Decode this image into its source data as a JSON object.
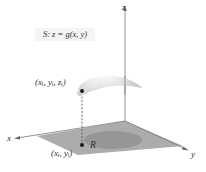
{
  "figure": {
    "surface_label": "S: z = g(x, y)",
    "point_surface_label": "(xᵢ, yᵢ, zᵢ)",
    "point_plane_label": "(xᵢ, yᵢ)",
    "region_label": "R",
    "axes": {
      "x": "x",
      "y": "y",
      "z": "z"
    }
  },
  "colors": {
    "plane": "#a9a9a9",
    "region": "#959595",
    "axis": "#777777",
    "surface_light": "#fafafa",
    "surface_dark": "#b5b5b5",
    "point": "#111111"
  }
}
